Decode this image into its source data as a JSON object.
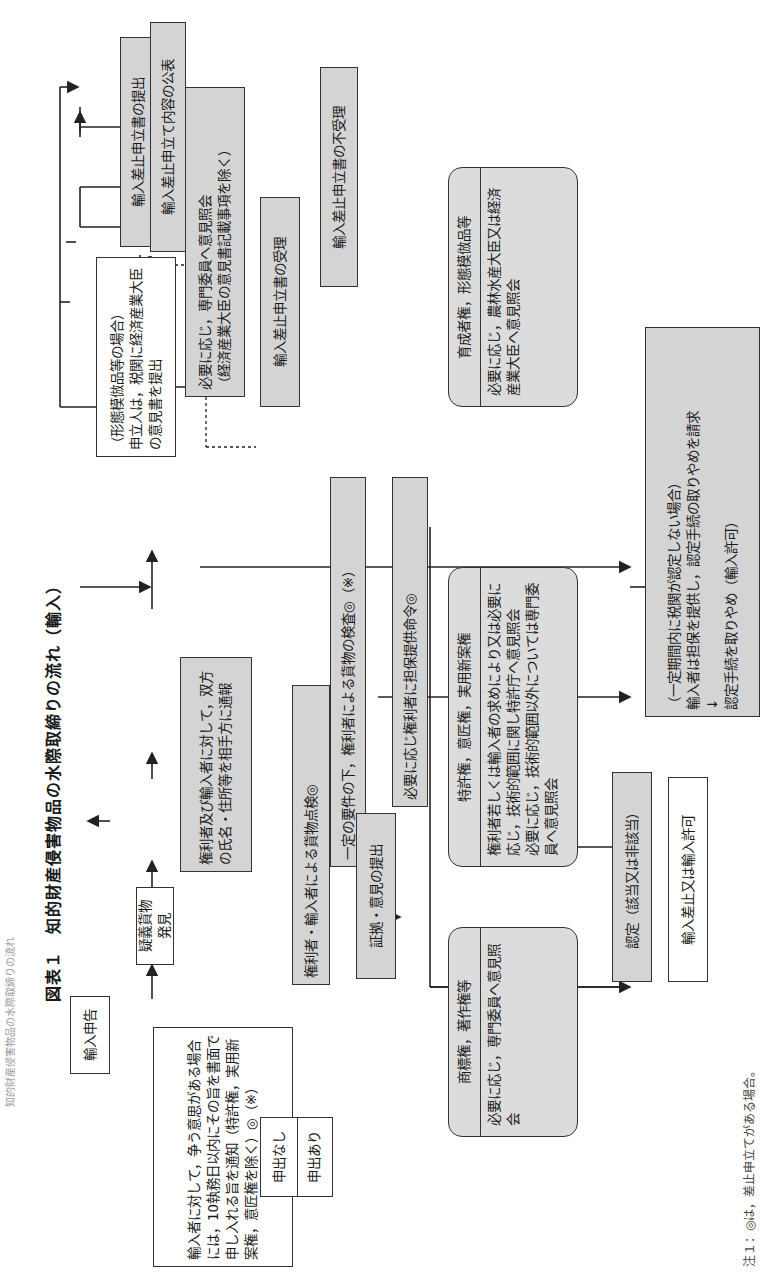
{
  "header": "知的財産侵害物品の水際取締りの流れ",
  "title": "図表１　知的財産侵害物品の水際取締りの流れ（輸入）",
  "nodes": {
    "import_declaration": "輸入申告",
    "suspect_found": "疑義貨物発見",
    "ex_officio": "職　権",
    "procedure_start": "認定手続開始",
    "notify_parties": "権利者及び輸入者に対して，双方の氏名・住所等を相手方に通報",
    "inspection_point": "権利者・輸入者による貨物点検◎",
    "inspection_cond": "一定の要件の下，権利者による貨物の検査◎（※）",
    "evidence": "証拠・意見の提出",
    "security_order": "必要に応じ権利者に担保提供命令◎",
    "dispute_notice": "輸入者に対して，争う意思がある場合には，10執務日以内にその旨を書面で申し入れる旨を通知（特許権，実用新案権，意匠権を除く）◎（※）",
    "applied_yes": "申出あり",
    "applied_no": "申出なし",
    "ministry_opinion": "（形態模倣品等の場合）\n申立人は，税関に経済産業大臣の意見書を提出",
    "petition_submit": "輸入差止申立書の提出",
    "petition_publish": "輸入差止申立て内容の公表",
    "expert_opinion": "必要に応じ，専門委員へ意見照会\n（経済産業大臣の意見書記載事項を除く）",
    "petition_accept": "輸入差止申立書の受理",
    "petition_reject": "輸入差止申立書の不受理",
    "determination": "認定（該当又は非該当）",
    "result": "輸入差止又は輸入許可",
    "withdraw_box": "（一定期間内に税関が認定しない場合）\n輸入者は担保を提供し，認定手続の取りやめを請求\n↓\n認定手続を取りやめ（輸入許可）"
  },
  "rights_boxes": [
    {
      "header": "商標権，著作権等",
      "body": "必要に応じ，専門委員へ意見照会"
    },
    {
      "header": "特許権，意匠権，実用新案権",
      "body": "権利者若しくは輸入者の求めにより又は必要に応じ，技術的範囲に関し特許庁へ意見照会\n必要に応じ，技術的範囲以外については専門委員へ意見照会"
    },
    {
      "header": "育成者権，形態模倣品等",
      "body": "必要に応じ，農林水産大臣又は経済産業大臣へ意見照会"
    }
  ],
  "footnote": "注１：◎は，差止申立てがある場合。"
}
